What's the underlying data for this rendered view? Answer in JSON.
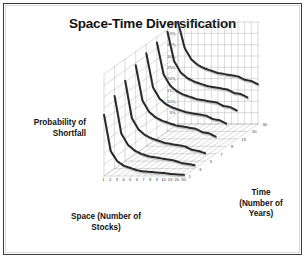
{
  "figure": {
    "title": "Space-Time Diversification",
    "background_color": "#ffffff",
    "border_color": "#3a3a3a",
    "inner_border_color": "#d8d8d8"
  },
  "axes": {
    "y_axis_title_line1": "Probability of",
    "y_axis_title_line2": "Shortfall",
    "x_axis_title_line1": "Space (Number of",
    "x_axis_title_line2": "Stocks)",
    "z_axis_title_line1": "Time",
    "z_axis_title_line2": "(Number of",
    "z_axis_title_line3": "Years)"
  },
  "chart_data": {
    "type": "line",
    "title": "Space-Time Diversification",
    "subtitle": "",
    "plot_style": "3d-surface-wireframe",
    "xlabel": "Space (Number of Stocks)",
    "ylabel": "Probability of Shortfall",
    "zlabel": "Time (Number of Years)",
    "grid": true,
    "legend_position": "none",
    "ylim": [
      0,
      45
    ],
    "y_tick_labels": [
      "0%",
      "5%",
      "10%",
      "15%",
      "20%",
      "25%",
      "30%",
      "35%",
      "40%",
      "45%"
    ],
    "y_tick_values": [
      0,
      5,
      10,
      15,
      20,
      25,
      30,
      35,
      40,
      45
    ],
    "x_tick_labels": [
      "1",
      "2",
      "3",
      "4",
      "5",
      "6",
      "7",
      "8",
      "9",
      "10",
      "15",
      "20",
      "50"
    ],
    "categories": [
      "1",
      "2",
      "3",
      "4",
      "5",
      "6",
      "7",
      "8",
      "9",
      "10",
      "15",
      "20",
      "50"
    ],
    "z_tick_labels": [
      "30",
      "20",
      "15",
      "9",
      "7",
      "5",
      "3",
      "1"
    ],
    "series": [
      {
        "name": "1",
        "z_value": 1,
        "values": [
          45,
          33.5,
          28.5,
          26,
          24.5,
          23.5,
          22.5,
          22,
          21.5,
          21,
          19.5,
          19,
          17.5
        ]
      },
      {
        "name": "3",
        "z_value": 3,
        "values": [
          44,
          31,
          26,
          23.5,
          22,
          21,
          20,
          19.5,
          19,
          18.5,
          17,
          16.5,
          15
        ]
      },
      {
        "name": "5",
        "z_value": 5,
        "values": [
          42.5,
          28.5,
          23.5,
          21,
          19.5,
          18.5,
          17.5,
          17,
          16.5,
          16,
          14.5,
          14,
          12.5
        ]
      },
      {
        "name": "7",
        "z_value": 7,
        "values": [
          41,
          26,
          21,
          18.5,
          17,
          16,
          15,
          14.5,
          14,
          13.5,
          12,
          11.5,
          10
        ]
      },
      {
        "name": "9",
        "z_value": 9,
        "values": [
          39,
          23.5,
          18.5,
          16,
          14.5,
          13.5,
          12.5,
          12,
          11.5,
          11,
          9.5,
          9,
          7.5
        ]
      },
      {
        "name": "15",
        "z_value": 15,
        "values": [
          35.5,
          19,
          14,
          11.5,
          10,
          9,
          8,
          7.5,
          7,
          6.5,
          5,
          4.5,
          3.5
        ]
      },
      {
        "name": "20",
        "z_value": 20,
        "values": [
          32,
          15.5,
          10.5,
          8,
          6.5,
          5.5,
          5,
          4.5,
          4,
          3.5,
          2.5,
          2,
          1.5
        ]
      },
      {
        "name": "30",
        "z_value": 30,
        "values": [
          27,
          11,
          6.5,
          4.5,
          3.5,
          2.5,
          2,
          1.8,
          1.5,
          1.3,
          0.9,
          0.7,
          0.5
        ]
      }
    ]
  },
  "render": {
    "origin_x": 104,
    "origin_y": 176,
    "x_span": 80,
    "y_span": 102,
    "depth_x": 74,
    "depth_y": -52,
    "grid_color": "#9a9a9a",
    "ribbon_dark": "#2a2a2a",
    "ribbon_light": "#e9e9e9",
    "tick_text_color": "#3d3d3d",
    "tick_font_size": 4.2
  }
}
